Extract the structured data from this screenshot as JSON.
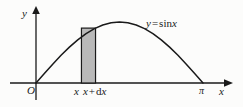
{
  "figure": {
    "type": "math-plot",
    "background_color": "#fcfcfb",
    "ink_color": "#1a1a1a",
    "bar_fill_color": "#b9b9b9",
    "bar_stroke_color": "#1a1a1a",
    "axes": {
      "y_axis_label": "y",
      "x_axis_label": "x",
      "origin_label": "O",
      "x_tick_labels": [
        "π"
      ]
    },
    "curve": {
      "equation_label_y": "y",
      "equation_label_eq": "=",
      "equation_label_fn": "sin",
      "equation_label_arg": "x",
      "domain_start": 0,
      "domain_end": "π",
      "amplitude": 1
    },
    "element_label": {
      "left_edge": "x",
      "right_edge_base": "x",
      "right_edge_plus": "+",
      "right_edge_d": "d",
      "right_edge_var": "x"
    }
  },
  "chart_data": {
    "type": "line",
    "title": "",
    "xlabel": "x",
    "ylabel": "y",
    "xlim": [
      0,
      3.14159
    ],
    "ylim": [
      0,
      1.15
    ],
    "grid": false,
    "legend": "none",
    "series": [
      {
        "name": "y = sin x",
        "x": [
          0,
          0.1571,
          0.3142,
          0.4712,
          0.6283,
          0.7854,
          0.9425,
          1.0996,
          1.2566,
          1.4137,
          1.5708,
          1.7279,
          1.885,
          2.042,
          2.1991,
          2.3562,
          2.5133,
          2.6704,
          2.8274,
          2.9845,
          3.1416
        ],
        "y": [
          0,
          0.1564,
          0.309,
          0.454,
          0.5878,
          0.7071,
          0.809,
          0.891,
          0.9511,
          0.9877,
          1.0,
          0.9877,
          0.9511,
          0.891,
          0.809,
          0.7071,
          0.5878,
          0.454,
          0.309,
          0.1564,
          0
        ]
      }
    ],
    "annotations": [
      {
        "kind": "rectangle",
        "label": "x  x + dx",
        "x_start": 0.855,
        "x_end": 1.12,
        "y_start": 0,
        "y_end": 0.9,
        "fill": "#b9b9b9"
      },
      {
        "kind": "text",
        "label": "y = sin x",
        "x": 2.23,
        "y": 1.0
      }
    ]
  }
}
